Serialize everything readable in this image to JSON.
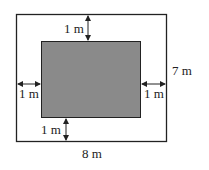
{
  "diagram": {
    "outer_rect": {
      "width_label": "8 m",
      "height_label": "7 m",
      "stroke": "#222222",
      "fill": "#ffffff"
    },
    "inner_rect": {
      "fill": "#8a8a8a",
      "stroke": "#222222"
    },
    "margins": {
      "top": "1 m",
      "bottom": "1 m",
      "left": "1 m",
      "right": "1 m"
    }
  }
}
